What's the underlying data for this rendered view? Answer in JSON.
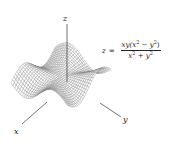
{
  "figure": {
    "type": "3d-wireframe-surface",
    "function": "z = xy(x^2 - y^2)/(x^2 + y^2)",
    "axes": {
      "x_label": "x",
      "y_label": "y",
      "z_label": "z"
    },
    "formula": {
      "lhs": "z",
      "equals": "=",
      "numerator_prefix": "xy(x",
      "numerator_mid": " − y",
      "numerator_suffix": ")",
      "denominator_a": "x",
      "denominator_plus": " + y",
      "exponent": "2"
    },
    "mesh": {
      "domain": [
        -2,
        2
      ],
      "divisions": 30,
      "z_scale": 0.55,
      "line_color": "#6a6a6a"
    }
  }
}
